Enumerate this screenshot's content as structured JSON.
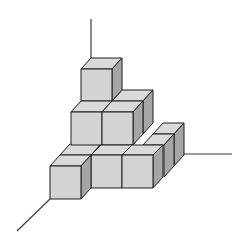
{
  "diagram": {
    "colors": {
      "front_face": "#d3d3d3",
      "top_face": "#dadada",
      "side_face": "#a6a6a6",
      "edge": "#1e1e1e",
      "axis": "#3a3a3a",
      "background": "#ffffff"
    },
    "axes": [
      {
        "name": "vertical-axis",
        "from": [
          91,
          19
        ],
        "to": [
          91,
          58
        ]
      },
      {
        "name": "horizontal-axis",
        "from": [
          184,
          154
        ],
        "to": [
          232,
          154
        ]
      },
      {
        "name": "depth-axis",
        "from": [
          50,
          199
        ],
        "to": [
          17,
          231
        ]
      }
    ],
    "levels": [
      {
        "level": 3,
        "cube_count": 1
      },
      {
        "level": 2,
        "cube_count": 3
      },
      {
        "level": 1,
        "cube_count": 6
      }
    ]
  }
}
